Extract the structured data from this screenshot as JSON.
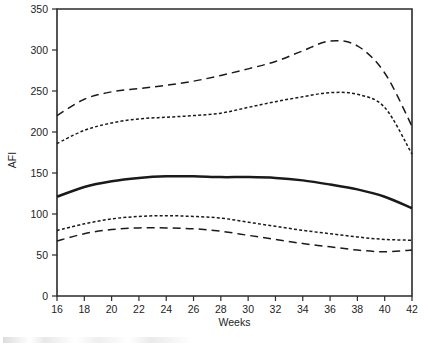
{
  "chart_data": {
    "type": "line",
    "title": "",
    "xlabel": "Weeks",
    "ylabel": "AFI",
    "xlim": [
      16,
      42
    ],
    "ylim": [
      0,
      350
    ],
    "grid": false,
    "legend": "none",
    "x_ticks": [
      16,
      18,
      20,
      22,
      24,
      26,
      28,
      30,
      32,
      34,
      36,
      38,
      40,
      42
    ],
    "y_ticks": [
      0,
      50,
      100,
      150,
      200,
      250,
      300,
      350
    ],
    "x": [
      16,
      18,
      20,
      22,
      24,
      26,
      28,
      30,
      32,
      34,
      36,
      38,
      40,
      42
    ],
    "series": [
      {
        "name": "97.5th percentile",
        "style": "long-dash",
        "values": [
          220,
          240,
          249,
          253,
          257,
          262,
          269,
          277,
          286,
          299,
          311,
          305,
          272,
          207
        ]
      },
      {
        "name": "95th percentile",
        "style": "short-dash",
        "values": [
          186,
          202,
          211,
          216,
          218,
          220,
          223,
          230,
          237,
          243,
          248,
          246,
          230,
          173
        ]
      },
      {
        "name": "50th percentile (median)",
        "style": "solid",
        "values": [
          121,
          133,
          140,
          144,
          146,
          146,
          145,
          145,
          144,
          141,
          136,
          130,
          121,
          107
        ]
      },
      {
        "name": "5th percentile",
        "style": "short-dash",
        "values": [
          80,
          88,
          94,
          97,
          98,
          97,
          95,
          90,
          85,
          80,
          76,
          72,
          69,
          68
        ]
      },
      {
        "name": "2.5th percentile",
        "style": "long-dash",
        "values": [
          67,
          76,
          81,
          83,
          83,
          82,
          79,
          74,
          69,
          64,
          60,
          56,
          54,
          56
        ]
      }
    ],
    "colors": {
      "axis": "#2b2b2b",
      "series": "#1a1a1a",
      "background": "#ffffff"
    }
  },
  "layout": {
    "plot_left": 57,
    "plot_right": 412,
    "plot_top": 9,
    "plot_bottom": 296,
    "tick_length": 5,
    "x_label_y": 326,
    "y_label_x": 16,
    "y_label_y": 160
  }
}
